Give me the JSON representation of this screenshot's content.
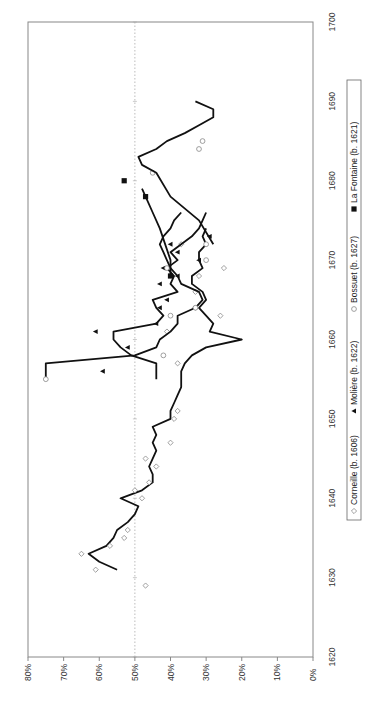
{
  "chart_data": {
    "type": "line",
    "orientation": "rotated-90-ccw",
    "title": "",
    "xlabel": "",
    "ylabel": "",
    "xlim": [
      1620,
      1700
    ],
    "ylim": [
      0,
      80
    ],
    "x_ticks": [
      "1620",
      "1630",
      "1640",
      "1650",
      "1660",
      "1670",
      "1680",
      "1690",
      "1700"
    ],
    "y_ticks": [
      "0%",
      "10%",
      "20%",
      "30%",
      "40%",
      "50%",
      "60%",
      "70%",
      "80%"
    ],
    "reference_line": {
      "value": 50,
      "style": "dotted"
    },
    "grid": false,
    "legend_position": "bottom",
    "series": [
      {
        "name": "Corneille (b. 1606)",
        "marker": "diamond-open",
        "line": [
          [
            1631,
            55
          ],
          [
            1632,
            60
          ],
          [
            1633,
            63
          ],
          [
            1634,
            58
          ],
          [
            1635,
            56
          ],
          [
            1636,
            55
          ],
          [
            1637,
            52
          ],
          [
            1638,
            50
          ],
          [
            1639,
            49
          ],
          [
            1640,
            54
          ],
          [
            1641,
            48
          ],
          [
            1642,
            45
          ],
          [
            1643,
            45
          ],
          [
            1644,
            46
          ],
          [
            1645,
            45
          ],
          [
            1646,
            44
          ],
          [
            1647,
            45
          ],
          [
            1648,
            44
          ],
          [
            1649,
            45
          ],
          [
            1650,
            40
          ],
          [
            1651,
            40
          ],
          [
            1652,
            39
          ],
          [
            1653,
            38
          ],
          [
            1654,
            37
          ],
          [
            1655,
            37
          ],
          [
            1656,
            37
          ],
          [
            1657,
            36
          ],
          [
            1658,
            34
          ],
          [
            1659,
            30
          ],
          [
            1660,
            20
          ],
          [
            1661,
            29
          ],
          [
            1662,
            28
          ],
          [
            1663,
            30
          ],
          [
            1664,
            32
          ],
          [
            1665,
            30
          ],
          [
            1666,
            31
          ],
          [
            1667,
            34
          ],
          [
            1668,
            34
          ],
          [
            1669,
            31
          ],
          [
            1670,
            32
          ],
          [
            1671,
            32
          ],
          [
            1672,
            30
          ],
          [
            1673,
            31
          ],
          [
            1674,
            30
          ]
        ],
        "points": [
          [
            1629,
            47
          ],
          [
            1631,
            61
          ],
          [
            1633,
            65
          ],
          [
            1634,
            57
          ],
          [
            1635,
            53
          ],
          [
            1636,
            52
          ],
          [
            1640,
            48
          ],
          [
            1641,
            50
          ],
          [
            1642,
            46
          ],
          [
            1644,
            44
          ],
          [
            1645,
            47
          ],
          [
            1647,
            40
          ],
          [
            1650,
            39
          ],
          [
            1651,
            38
          ],
          [
            1657,
            38
          ],
          [
            1661,
            41
          ],
          [
            1663,
            26
          ],
          [
            1664,
            33
          ],
          [
            1666,
            33
          ],
          [
            1668,
            32
          ],
          [
            1669,
            25
          ],
          [
            1672,
            37
          ]
        ]
      },
      {
        "name": "Molière (b. 1622)",
        "marker": "triangle-filled",
        "line": [
          [
            1655,
            44
          ],
          [
            1657,
            44
          ],
          [
            1658,
            51
          ],
          [
            1659,
            54
          ],
          [
            1660,
            56
          ],
          [
            1661,
            56
          ],
          [
            1662,
            44
          ],
          [
            1663,
            42
          ],
          [
            1664,
            44
          ],
          [
            1665,
            45
          ],
          [
            1666,
            38
          ],
          [
            1667,
            40
          ],
          [
            1668,
            39
          ],
          [
            1669,
            41
          ],
          [
            1670,
            38
          ],
          [
            1671,
            40
          ],
          [
            1672,
            37
          ],
          [
            1673,
            34
          ],
          [
            1674,
            32
          ],
          [
            1675,
            31
          ],
          [
            1676,
            30
          ]
        ],
        "points": [
          [
            1656,
            59
          ],
          [
            1659,
            52
          ],
          [
            1661,
            61
          ],
          [
            1662,
            44
          ],
          [
            1664,
            43
          ],
          [
            1665,
            41
          ],
          [
            1667,
            43
          ],
          [
            1668,
            38
          ],
          [
            1669,
            42
          ],
          [
            1670,
            32
          ],
          [
            1671,
            38
          ],
          [
            1672,
            40
          ],
          [
            1673,
            29
          ]
        ]
      },
      {
        "name": "Bossuet (b. 1627)",
        "marker": "circle-open",
        "line": [
          [
            1655,
            75
          ],
          [
            1657,
            75
          ],
          [
            1658,
            50
          ],
          [
            1659,
            44
          ],
          [
            1660,
            43
          ],
          [
            1661,
            40
          ],
          [
            1662,
            38
          ],
          [
            1663,
            38
          ],
          [
            1664,
            33
          ],
          [
            1665,
            31
          ],
          [
            1666,
            32
          ],
          [
            1667,
            37
          ],
          [
            1668,
            38
          ],
          [
            1669,
            40
          ],
          [
            1670,
            41
          ],
          [
            1671,
            42
          ],
          [
            1672,
            43
          ],
          [
            1673,
            42
          ],
          [
            1674,
            40
          ],
          [
            1675,
            39
          ],
          [
            1676,
            37
          ]
        ],
        "points": [
          [
            1655,
            75
          ],
          [
            1658,
            42
          ],
          [
            1663,
            40
          ],
          [
            1664,
            33
          ],
          [
            1669,
            41
          ],
          [
            1670,
            30
          ],
          [
            1672,
            30
          ],
          [
            1681,
            45
          ],
          [
            1684,
            32
          ],
          [
            1685,
            31
          ]
        ]
      },
      {
        "name": "La Fontaine (b. 1621)",
        "marker": "square-filled",
        "line": [
          [
            1668,
            40
          ],
          [
            1670,
            40
          ],
          [
            1674,
            43
          ],
          [
            1676,
            45
          ],
          [
            1678,
            47
          ],
          [
            1679,
            48
          ]
        ],
        "points": [
          [
            1668,
            40
          ],
          [
            1678,
            47
          ],
          [
            1680,
            53
          ]
        ]
      },
      {
        "name": "Late combined trend",
        "marker": "none",
        "line": [
          [
            1672,
            28
          ],
          [
            1675,
            32
          ],
          [
            1678,
            40
          ],
          [
            1681,
            44
          ],
          [
            1682,
            48
          ],
          [
            1683,
            49
          ],
          [
            1684,
            44
          ],
          [
            1685,
            41
          ],
          [
            1686,
            36
          ],
          [
            1687,
            32
          ],
          [
            1688,
            28
          ],
          [
            1689,
            28
          ],
          [
            1690,
            33
          ]
        ],
        "points": []
      }
    ]
  },
  "legend": {
    "items": [
      {
        "marker": "◇",
        "label": "Corneille (b. 1606)"
      },
      {
        "marker": "▲",
        "label": "Molière (b. 1622)"
      },
      {
        "marker": "○",
        "label": "Bossuet (b. 1627)"
      },
      {
        "marker": "■",
        "label": "La Fontaine (b. 1621)"
      }
    ]
  },
  "colors": {
    "line": "#111111",
    "marker_open": "#888888",
    "marker_filled": "#111111",
    "frame": "#888888",
    "reference": "#aaaaaa"
  }
}
